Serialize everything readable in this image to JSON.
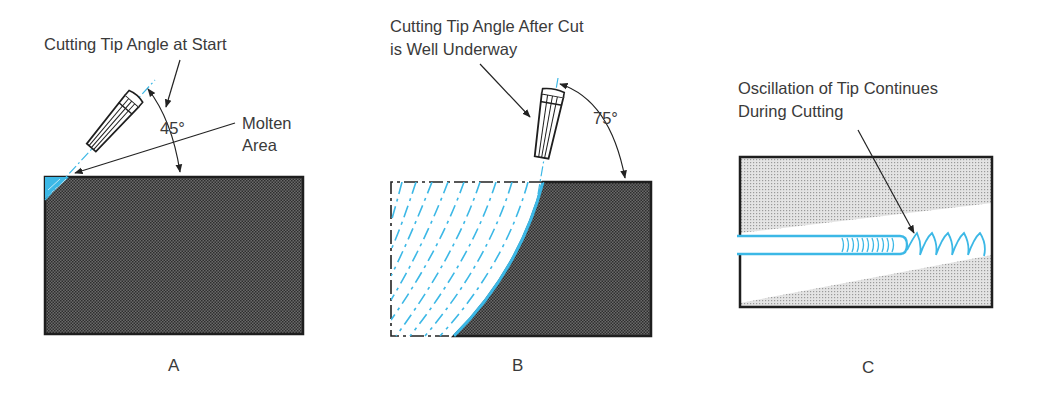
{
  "figure": {
    "colors": {
      "accent_blue": "#3cb8e6",
      "ink": "#222222",
      "metal_fill_dark": "#4a4a4a",
      "metal_fill_light": "#c9c9c9"
    },
    "panels": [
      {
        "id": "A",
        "letter": "A",
        "caption": "Cutting Tip Angle at Start",
        "angle_label": "45°",
        "callout": "Molten\nArea",
        "callout_line1": "Molten",
        "callout_line2": "Area"
      },
      {
        "id": "B",
        "letter": "B",
        "caption_line1": "Cutting Tip Angle After Cut",
        "caption_line2": "is Well Underway",
        "angle_label": "75°"
      },
      {
        "id": "C",
        "letter": "C",
        "caption_line1": "Oscillation of Tip Continues",
        "caption_line2": "During Cutting"
      }
    ]
  }
}
